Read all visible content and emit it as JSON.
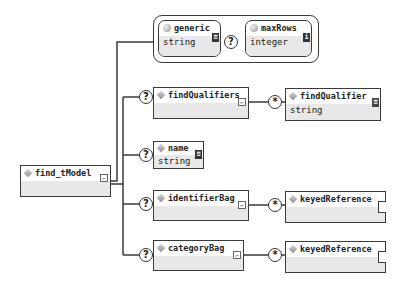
{
  "diagram": {
    "root": {
      "name": "find_tModel",
      "icon": "element-diamond-icon"
    },
    "attributes_group": {
      "items": [
        {
          "name": "generic",
          "type": "string",
          "occurrence": "",
          "icon": "attribute-dot-icon"
        },
        {
          "name": "maxRows",
          "type": "integer",
          "occurrence": "?",
          "icon": "attribute-dot-icon"
        }
      ]
    },
    "children": [
      {
        "name": "findQualifiers",
        "occurrence": "?",
        "type": "",
        "child": {
          "name": "findQualifier",
          "type": "string",
          "occurrence": "*"
        }
      },
      {
        "name": "name",
        "occurrence": "?",
        "type": "string"
      },
      {
        "name": "identifierBag",
        "occurrence": "?",
        "type": "",
        "child": {
          "name": "keyedReference",
          "type": "",
          "occurrence": "*"
        }
      },
      {
        "name": "categoryBag",
        "occurrence": "?",
        "type": "",
        "child": {
          "name": "keyedReference",
          "type": "",
          "occurrence": "*"
        }
      }
    ],
    "colors": {
      "line": "#3a3a3a",
      "body_fill": "#e8e8e8",
      "background": "#ffffff"
    }
  }
}
